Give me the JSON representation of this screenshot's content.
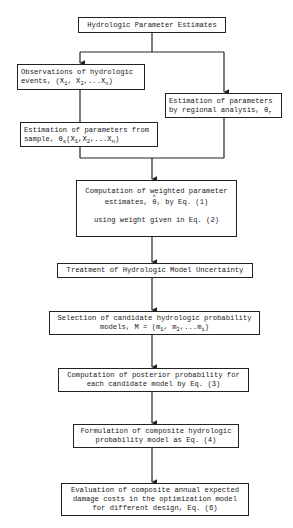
{
  "diagram": {
    "type": "flowchart",
    "nodes": [
      {
        "id": "n1",
        "label": "Hydrologic Parameter Estimates"
      },
      {
        "id": "n2",
        "line1": "Observations of hydrologic",
        "line2_prefix": "events, (X",
        "line2_mid1": ", X",
        "line2_mid2": ",...X",
        "line2_suffix": ")",
        "sub1": "1",
        "sub2": "2",
        "subn": "n"
      },
      {
        "id": "n3",
        "line1": "Estimation of parameters",
        "line2_prefix": "by regional analysis, θ",
        "sub": "r"
      },
      {
        "id": "n4",
        "line1": "Estimation of parameters from",
        "line2_prefix": "sample, θ",
        "sub_s": "s",
        "line2_args": "(X",
        "sub1": "1",
        "mid1": ",X",
        "sub2": "2",
        "mid2": ",...X",
        "subn": "n",
        "suffix": ")"
      },
      {
        "id": "n5",
        "line1": "Computation of weighted parameter",
        "line2_prefix": "estimates, ",
        "theta": "θ",
        "line2_suffix": ", by Eq. (1)",
        "line3": "using weight given in Eq. (2)"
      },
      {
        "id": "n6",
        "label": "Treatment of Hydrologic Model Uncertainty"
      },
      {
        "id": "n7",
        "line1": "Selection of candidate hydrologic probability",
        "line2_prefix": "models, M = (m",
        "sub1": "1",
        "mid1": ", m",
        "sub2": "2",
        "mid2": ",...m",
        "subi": "i",
        "suffix": ")"
      },
      {
        "id": "n8",
        "line1": "Computation of posterior probability for",
        "line2": "each candidate model by Eq. (3)"
      },
      {
        "id": "n9",
        "line1": "Formulation of composite hydrologic",
        "line2": "probability model as Eq. (4)"
      },
      {
        "id": "n10",
        "line1": "Evaluation of composite annual expected",
        "line2": "damage costs in the optimization model",
        "line3": "for different design, Eq. (6)"
      }
    ],
    "edges": [
      [
        "n1",
        "n2"
      ],
      [
        "n1",
        "n3"
      ],
      [
        "n2",
        "n4"
      ],
      [
        "n4",
        "n5"
      ],
      [
        "n3",
        "n5"
      ],
      [
        "n5",
        "n6"
      ],
      [
        "n6",
        "n7"
      ],
      [
        "n7",
        "n8"
      ],
      [
        "n8",
        "n9"
      ],
      [
        "n9",
        "n10"
      ]
    ]
  }
}
